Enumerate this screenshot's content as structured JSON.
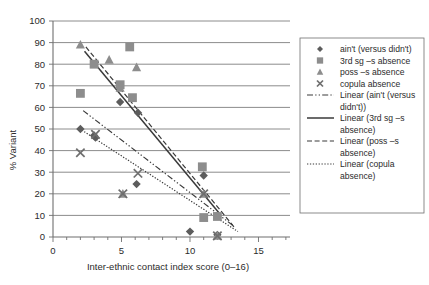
{
  "chart_data": {
    "type": "scatter",
    "title": "",
    "xlabel": "Inter-ethnic contact index score (0–16)",
    "ylabel": "% Variant",
    "xlim": [
      0,
      16
    ],
    "ylim": [
      0,
      100
    ],
    "xticks": [
      0,
      5,
      10,
      15
    ],
    "xtick_labels": [
      "0",
      "5",
      "10",
      "15"
    ],
    "yticks": [
      0,
      10,
      20,
      30,
      40,
      50,
      60,
      70,
      80,
      90,
      100
    ],
    "ytick_labels": [
      "0",
      "10",
      "20",
      "30",
      "40",
      "50",
      "60",
      "70",
      "80",
      "90",
      "100"
    ],
    "grid": "horizontal",
    "legend_position": "right",
    "series": [
      {
        "name": "ain't (versus didn't)",
        "marker": "diamond",
        "color": "#5c5c5c",
        "points": [
          {
            "x": 2.0,
            "y": 50.0
          },
          {
            "x": 3.0,
            "y": 47.0
          },
          {
            "x": 3.1,
            "y": 46.0
          },
          {
            "x": 4.9,
            "y": 62.5
          },
          {
            "x": 6.1,
            "y": 24.5
          },
          {
            "x": 6.2,
            "y": 57.5
          },
          {
            "x": 10.0,
            "y": 2.5
          },
          {
            "x": 11.0,
            "y": 28.5
          },
          {
            "x": 12.0,
            "y": 1.0
          }
        ]
      },
      {
        "name": "3rd sg –s absence",
        "marker": "square",
        "color": "#8d8d8d",
        "points": [
          {
            "x": 2.0,
            "y": 66.5
          },
          {
            "x": 3.0,
            "y": 80.0
          },
          {
            "x": 4.9,
            "y": 70.5
          },
          {
            "x": 5.6,
            "y": 88.0
          },
          {
            "x": 5.8,
            "y": 64.5
          },
          {
            "x": 10.9,
            "y": 32.5
          },
          {
            "x": 11.0,
            "y": 9.0
          },
          {
            "x": 12.0,
            "y": 9.5
          }
        ]
      },
      {
        "name": "poss –s absence",
        "marker": "triangle",
        "color": "#8d8d8d",
        "points": [
          {
            "x": 2.0,
            "y": 89.0
          },
          {
            "x": 4.1,
            "y": 82.0
          },
          {
            "x": 4.9,
            "y": 69.0
          },
          {
            "x": 6.1,
            "y": 78.5
          },
          {
            "x": 5.1,
            "y": 20.0
          },
          {
            "x": 11.0,
            "y": 20.0
          },
          {
            "x": 12.0,
            "y": 0.5
          }
        ]
      },
      {
        "name": "copula absence",
        "marker": "cross",
        "color": "#6f6f6f",
        "points": [
          {
            "x": 2.0,
            "y": 39.0
          },
          {
            "x": 3.1,
            "y": 47.5
          },
          {
            "x": 5.1,
            "y": 20.0
          },
          {
            "x": 6.2,
            "y": 29.5
          },
          {
            "x": 11.0,
            "y": 20.0
          },
          {
            "x": 12.0,
            "y": 0.5
          }
        ]
      }
    ],
    "trendlines": [
      {
        "name": "Linear (ain't (versus didn't))",
        "style": "dash-dot",
        "x1": 2.2,
        "y1": 58.5,
        "x2": 13.2,
        "y2": 5.0
      },
      {
        "name": "Linear (3rd sg –s absence)",
        "style": "solid",
        "x1": 2.3,
        "y1": 86.0,
        "x2": 12.2,
        "y2": 10.5
      },
      {
        "name": "Linear (poss –s absence)",
        "style": "dashed",
        "x1": 2.4,
        "y1": 88.0,
        "x2": 13.3,
        "y2": 4.0
      },
      {
        "name": "Linear (copula absence)",
        "style": "dotted",
        "x1": 2.1,
        "y1": 49.5,
        "x2": 13.5,
        "y2": 2.5
      }
    ]
  },
  "legend": {
    "items": [
      {
        "label": "ain't (versus didn't)",
        "kind": "marker",
        "marker": "diamond"
      },
      {
        "label": "3rd sg –s absence",
        "kind": "marker",
        "marker": "square"
      },
      {
        "label": "poss –s absence",
        "kind": "marker",
        "marker": "triangle"
      },
      {
        "label": "copula absence",
        "kind": "marker",
        "marker": "cross"
      },
      {
        "label": "Linear (ain't (versus",
        "label2": "didn't))",
        "kind": "line",
        "style": "dash-dot"
      },
      {
        "label": "Linear (3rd sg –s",
        "label2": "absence)",
        "kind": "line",
        "style": "solid"
      },
      {
        "label": "Linear (poss –s",
        "label2": "absence)",
        "kind": "line",
        "style": "dashed"
      },
      {
        "label": "Linear (copula",
        "label2": "absence)",
        "kind": "line",
        "style": "dotted"
      }
    ]
  },
  "colors": {
    "axis": "#6f6f6f",
    "text": "#2b2b2b",
    "diamond": "#5c5c5c",
    "square": "#8d8d8d",
    "triangle": "#8d8d8d",
    "cross": "#6f6f6f",
    "background": "#ffffff"
  }
}
